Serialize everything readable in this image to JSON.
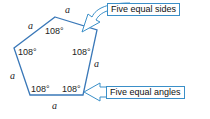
{
  "diagram": {
    "shape": "regular pentagon",
    "side_label": "a",
    "angle_label": "108°",
    "callouts": {
      "sides": "Five equal sides",
      "angles": "Five equal angles"
    },
    "colors": {
      "pentagon_stroke": "#3a78b8",
      "arrow_stroke": "#3a8fc8",
      "text": "#222222"
    }
  }
}
